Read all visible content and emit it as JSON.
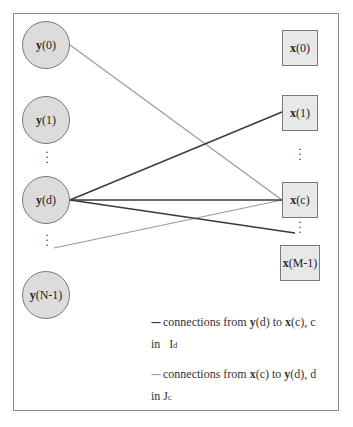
{
  "diagram": {
    "y_nodes": [
      {
        "id": "y0",
        "vec": "y",
        "idx": "(0)"
      },
      {
        "id": "y1",
        "vec": "y",
        "idx": "(1)"
      },
      {
        "id": "yd",
        "vec": "y",
        "idx": "(d)"
      },
      {
        "id": "yN1",
        "vec": "y",
        "idx": "(N-1)"
      }
    ],
    "x_nodes": [
      {
        "id": "x0",
        "vec": "x",
        "idx": "(0)"
      },
      {
        "id": "x1",
        "vec": "x",
        "idx": "(1)"
      },
      {
        "id": "xc",
        "vec": "x",
        "idx": "(c)"
      },
      {
        "id": "xM1",
        "vec": "x",
        "idx": "(M-1)"
      }
    ],
    "ellipsis": "⋮",
    "edges": {
      "dark": [
        {
          "from": "y(d)",
          "to": "x(1)"
        },
        {
          "from": "y(d)",
          "to": "x(c)"
        },
        {
          "from": "y(d)",
          "to": "x(M-1) ellipsis"
        }
      ],
      "light": [
        {
          "from": "x(c)",
          "to": "y(0)"
        },
        {
          "from": "x(c)",
          "to": "y ellipsis below y(d)"
        }
      ]
    },
    "colors": {
      "dark_edge": "#3a3a3a",
      "light_edge": "#9a9a9a",
      "circle_fill": "#dcdcdc",
      "square_fill": "#e8e8e8"
    },
    "legend": {
      "dark": {
        "dash": "---",
        "text1": " connections from ",
        "v1": "y",
        "i1": "(d) to ",
        "v2": "x",
        "i2": "(c), c",
        "line2": "in   I",
        "sub": "d"
      },
      "light": {
        "dash": "---",
        "text1": " connections from ",
        "v1": "x",
        "i1": "(c) to ",
        "v2": "y",
        "i2": "(d), d",
        "line2": "in J",
        "sub": "c"
      }
    }
  }
}
